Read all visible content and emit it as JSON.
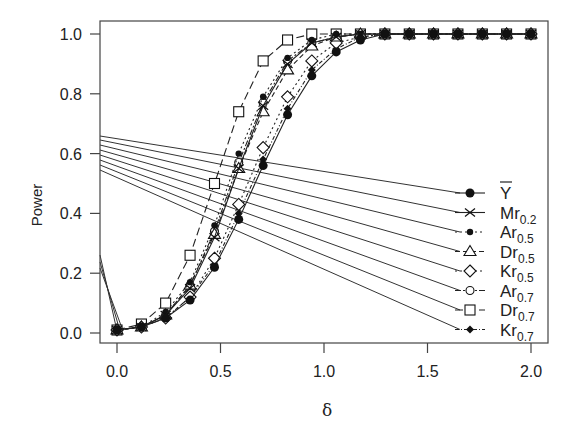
{
  "chart_data": {
    "type": "line",
    "title": "",
    "xlabel": "δ",
    "ylabel": "Power",
    "xlim": [
      -0.08,
      2.08
    ],
    "ylim": [
      -0.03,
      1.04
    ],
    "xticks": [
      "0.0",
      "0.5",
      "1.0",
      "1.5",
      "2.0"
    ],
    "xtick_values": [
      0.0,
      0.5,
      1.0,
      1.5,
      2.0
    ],
    "yticks": [
      "0.0",
      "0.2",
      "0.4",
      "0.6",
      "0.8",
      "1.0"
    ],
    "ytick_values": [
      0.0,
      0.2,
      0.4,
      0.6,
      0.8,
      1.0
    ],
    "grid": false,
    "legend_position": "right-middle",
    "x": [
      0.0,
      0.118,
      0.235,
      0.353,
      0.471,
      0.588,
      0.706,
      0.824,
      0.941,
      1.059,
      1.176,
      1.294,
      1.412,
      1.529,
      1.647,
      1.765,
      1.882,
      2.0
    ],
    "series": [
      {
        "name": "Ȳ",
        "label_main": "Y",
        "label_sub": "",
        "overbar": true,
        "marker": "filled-circle",
        "dash": "",
        "values": [
          0.01,
          0.02,
          0.05,
          0.11,
          0.22,
          0.38,
          0.56,
          0.73,
          0.86,
          0.94,
          0.98,
          1.0,
          1.0,
          1.0,
          1.0,
          1.0,
          1.0,
          1.0
        ]
      },
      {
        "name": "Mr0.2",
        "label_main": "Mr",
        "label_sub": "0.2",
        "overbar": false,
        "marker": "cross",
        "dash": "",
        "values": [
          0.01,
          0.02,
          0.06,
          0.15,
          0.32,
          0.55,
          0.76,
          0.9,
          0.97,
          0.99,
          1.0,
          1.0,
          1.0,
          1.0,
          1.0,
          1.0,
          1.0,
          1.0
        ]
      },
      {
        "name": "Ar0.5",
        "label_main": "Ar",
        "label_sub": "0.5",
        "overbar": false,
        "marker": "small-dot",
        "dash": "2,3",
        "values": [
          0.01,
          0.02,
          0.07,
          0.17,
          0.36,
          0.6,
          0.79,
          0.92,
          0.98,
          1.0,
          1.0,
          1.0,
          1.0,
          1.0,
          1.0,
          1.0,
          1.0,
          1.0
        ]
      },
      {
        "name": "Dr0.5",
        "label_main": "Dr",
        "label_sub": "0.5",
        "overbar": false,
        "marker": "triangle",
        "dash": "5,3",
        "values": [
          0.01,
          0.02,
          0.06,
          0.16,
          0.33,
          0.55,
          0.74,
          0.88,
          0.96,
          0.99,
          1.0,
          1.0,
          1.0,
          1.0,
          1.0,
          1.0,
          1.0,
          1.0
        ]
      },
      {
        "name": "Kr0.5",
        "label_main": "Kr",
        "label_sub": "0.5",
        "overbar": false,
        "marker": "diamond",
        "dash": "2,3",
        "values": [
          0.01,
          0.02,
          0.05,
          0.12,
          0.25,
          0.43,
          0.62,
          0.79,
          0.91,
          0.97,
          0.99,
          1.0,
          1.0,
          1.0,
          1.0,
          1.0,
          1.0,
          1.0
        ]
      },
      {
        "name": "Ar0.7",
        "label_main": "Ar",
        "label_sub": "0.7",
        "overbar": false,
        "marker": "open-circle",
        "dash": "6,2,2,2",
        "values": [
          0.01,
          0.02,
          0.06,
          0.16,
          0.34,
          0.57,
          0.77,
          0.91,
          0.97,
          0.99,
          1.0,
          1.0,
          1.0,
          1.0,
          1.0,
          1.0,
          1.0,
          1.0
        ]
      },
      {
        "name": "Dr0.7",
        "label_main": "Dr",
        "label_sub": "0.7",
        "overbar": false,
        "marker": "square",
        "dash": "8,4",
        "values": [
          0.01,
          0.03,
          0.1,
          0.26,
          0.5,
          0.74,
          0.91,
          0.98,
          1.0,
          1.0,
          1.0,
          1.0,
          1.0,
          1.0,
          1.0,
          1.0,
          1.0,
          1.0
        ]
      },
      {
        "name": "Kr0.7",
        "label_main": "Kr",
        "label_sub": "0.7",
        "overbar": false,
        "marker": "small-diamond-filled",
        "dash": "4,2,1,2",
        "values": [
          0.01,
          0.02,
          0.05,
          0.12,
          0.23,
          0.4,
          0.58,
          0.75,
          0.88,
          0.95,
          0.99,
          1.0,
          1.0,
          1.0,
          1.0,
          1.0,
          1.0,
          1.0
        ]
      }
    ],
    "annotations": "Legend leader lines connect from left y-axis region to each legend entry"
  }
}
